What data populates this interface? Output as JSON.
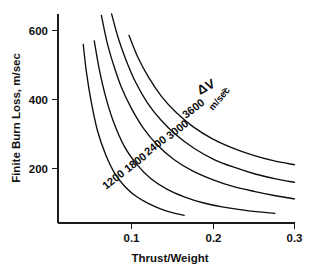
{
  "chart_data": {
    "type": "line",
    "title": "",
    "xlabel": "Thrust/Weight",
    "ylabel": "Finite Burn Loss, m/sec",
    "xlim": [
      0.0,
      0.3
    ],
    "ylim": [
      0,
      700
    ],
    "xticks": [
      "0.1",
      "0.2",
      "0.3"
    ],
    "xtick_values": [
      0.1,
      0.2,
      0.3
    ],
    "yticks": [
      "200",
      "400",
      "600"
    ],
    "ytick_values": [
      200,
      400,
      600
    ],
    "grid": false,
    "legend_position": "inline-curve-labels",
    "annotations": [
      {
        "id": "delta-v-legend",
        "text": "ΔV",
        "suffix": "=",
        "units": "m/sec"
      }
    ],
    "series": [
      {
        "name": "1200",
        "label": "1200",
        "label_units": "",
        "x": [
          0.0255,
          0.028,
          0.032,
          0.036,
          0.042,
          0.05,
          0.06,
          0.072,
          0.086,
          0.1,
          0.115,
          0.13,
          0.145,
          0.16
        ],
        "y": [
          700,
          655,
          560,
          480,
          395,
          310,
          243,
          186,
          145,
          118,
          98,
          83,
          72,
          64
        ]
      },
      {
        "name": "1800",
        "label": "1800",
        "label_units": "",
        "x": [
          0.0375,
          0.041,
          0.046,
          0.052,
          0.06,
          0.07,
          0.084,
          0.1,
          0.118,
          0.138,
          0.16,
          0.185,
          0.21,
          0.24,
          0.275
        ],
        "y": [
          700,
          650,
          570,
          492,
          412,
          338,
          265,
          212,
          170,
          140,
          118,
          100,
          88,
          78,
          70
        ]
      },
      {
        "name": "2400",
        "label": "2400",
        "label_units": "",
        "x": [
          0.05,
          0.055,
          0.062,
          0.07,
          0.08,
          0.093,
          0.108,
          0.126,
          0.147,
          0.17,
          0.196,
          0.222,
          0.25,
          0.276,
          0.3
        ],
        "y": [
          700,
          644,
          568,
          504,
          438,
          375,
          318,
          268,
          226,
          194,
          168,
          148,
          133,
          121,
          112
        ]
      },
      {
        "name": "3000",
        "label": "3000",
        "label_units": "",
        "x": [
          0.0625,
          0.068,
          0.076,
          0.086,
          0.098,
          0.113,
          0.13,
          0.15,
          0.173,
          0.198,
          0.224,
          0.25,
          0.276,
          0.3
        ],
        "y": [
          700,
          648,
          581,
          516,
          452,
          392,
          342,
          297,
          258,
          226,
          203,
          184,
          170,
          160
        ]
      },
      {
        "name": "3600",
        "label": "3600",
        "label_units": "m/sec",
        "x": [
          0.0745,
          0.081,
          0.09,
          0.101,
          0.115,
          0.131,
          0.15,
          0.172,
          0.196,
          0.221,
          0.247,
          0.273,
          0.3
        ],
        "y": [
          700,
          650,
          586,
          524,
          464,
          410,
          362,
          320,
          286,
          260,
          239,
          223,
          211
        ]
      }
    ]
  },
  "figure": {
    "background_color": "#ffffff",
    "line_color": "#0d0d0d",
    "axis_color": "#1a1a1a"
  }
}
